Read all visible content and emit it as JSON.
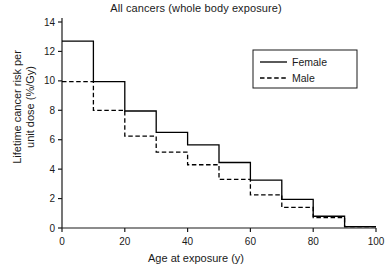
{
  "chart_data": {
    "type": "line",
    "title": "All cancers (whole body exposure)",
    "xlabel": "Age at exposure (y)",
    "ylabel_line1": "Lifetime cancer risk per",
    "ylabel_line2": "unit dose (%/Gy)",
    "xlim": [
      0,
      100
    ],
    "ylim": [
      0,
      14
    ],
    "xticks": [
      0,
      20,
      40,
      60,
      80,
      100
    ],
    "xtick_labels": [
      "0",
      "20",
      "40",
      "60",
      "80",
      "100"
    ],
    "yticks": [
      0,
      2,
      4,
      6,
      8,
      10,
      12,
      14
    ],
    "ytick_labels": [
      "0",
      "2",
      "4",
      "6",
      "8",
      "10",
      "12",
      "14"
    ],
    "grid": false,
    "legend_position": "upper right",
    "drawstyle": "steps-post",
    "bin_edges": [
      0,
      10,
      20,
      30,
      40,
      50,
      60,
      70,
      80,
      90,
      100
    ],
    "series": [
      {
        "name": "Female",
        "style": "solid",
        "color": "#000000",
        "values": [
          12.7,
          9.95,
          7.95,
          6.5,
          5.65,
          4.45,
          3.25,
          1.95,
          0.8,
          0.1
        ]
      },
      {
        "name": "Male",
        "style": "dashed",
        "color": "#000000",
        "values": [
          9.95,
          8.0,
          6.25,
          5.15,
          4.3,
          3.3,
          2.25,
          1.4,
          0.7,
          0.1
        ]
      }
    ]
  },
  "legend": {
    "entries": [
      {
        "label": "Female",
        "style": "solid"
      },
      {
        "label": "Male",
        "style": "dashed"
      }
    ]
  }
}
